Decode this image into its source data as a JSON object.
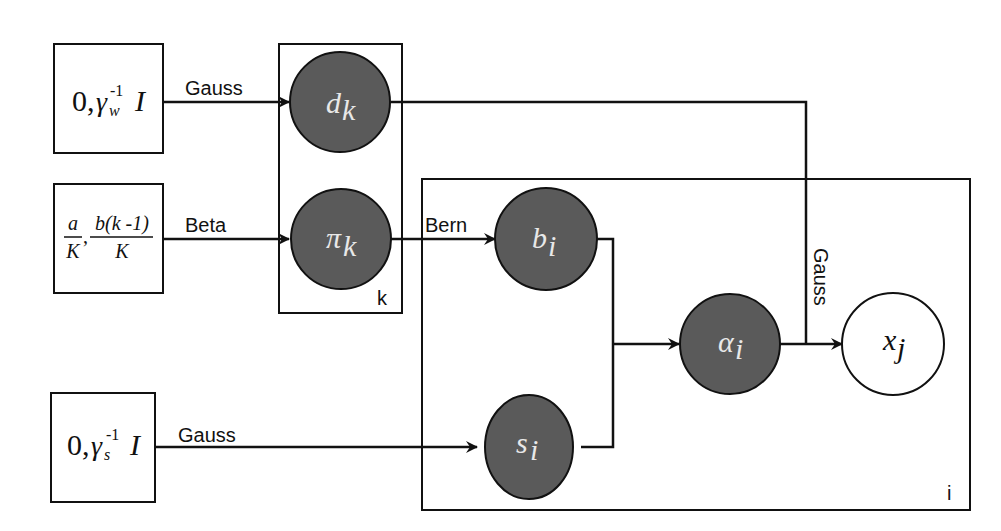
{
  "diagram": {
    "type": "graphical-model",
    "colors": {
      "observed_fill": "#5a5a5a",
      "latent_fill": "#ffffff",
      "stroke": "#111111",
      "background": "#ffffff"
    },
    "priors": [
      {
        "id": "prior_w",
        "text_main": "0,",
        "text_gamma": "γ",
        "text_sub": "w",
        "text_sup": "-1",
        "text_I": "I"
      },
      {
        "id": "prior_pi",
        "frac1_num": "a",
        "frac1_den": "K",
        "comma": ",",
        "frac2_num": "b(k -1)",
        "frac2_den": "K"
      },
      {
        "id": "prior_s",
        "text_main": "0,",
        "text_gamma": "γ",
        "text_sub": "s",
        "text_sup": "-1",
        "text_I": "I"
      }
    ],
    "nodes": [
      {
        "id": "d",
        "base": "d",
        "sub": "k",
        "shaded": true
      },
      {
        "id": "pi",
        "base": "π",
        "sub": "k",
        "shaded": true
      },
      {
        "id": "b",
        "base": "b",
        "sub": "i",
        "shaded": true
      },
      {
        "id": "s",
        "base": "s",
        "sub": "i",
        "shaded": true
      },
      {
        "id": "alpha",
        "base": "α",
        "sub": "i",
        "shaded": true
      },
      {
        "id": "x",
        "base": "x",
        "sub": "j",
        "shaded": false
      }
    ],
    "edge_labels": {
      "w_to_d": "Gauss",
      "prior_to_pi": "Beta",
      "pi_to_b": "Bern",
      "s_prior_to_s": "Gauss",
      "d_to_x": "Gauss"
    },
    "plates": {
      "k": "k",
      "i": "i"
    }
  }
}
